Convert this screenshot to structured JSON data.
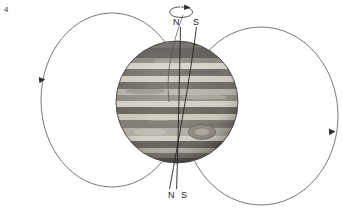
{
  "figure": {
    "number": "4"
  },
  "labels": {
    "top_north": "N",
    "top_south": "S",
    "bottom_north": "N",
    "bottom_south": "S"
  },
  "icons": {
    "rotation_arrow": "rotation-direction-arrow",
    "left_field_arrow": "field-line-direction-arrow-left",
    "right_field_arrow": "field-line-direction-arrow-right"
  },
  "colors": {
    "background": "#ffffff",
    "line": "#4a4a4a",
    "axis_line": "#2b2b2b",
    "text": "#1a1a1a",
    "planet_light_band": "#d8d3c8",
    "planet_dark_band": "#6d6a64",
    "planet_mid_band": "#9b968c",
    "planet_edge": "#3d3b37",
    "red_spot": "#8d867c"
  },
  "planet": {
    "name": "jupiter",
    "center_x": 177,
    "center_y": 102,
    "radius": 61,
    "great_red_spot": {
      "cx": 202,
      "cy": 132,
      "rx": 13,
      "ry": 7
    },
    "bands": [
      {
        "y": 0.06,
        "h": 0.09,
        "tone": "dark"
      },
      {
        "y": 0.16,
        "h": 0.05,
        "tone": "light"
      },
      {
        "y": 0.21,
        "h": 0.06,
        "tone": "dark"
      },
      {
        "y": 0.28,
        "h": 0.05,
        "tone": "light"
      },
      {
        "y": 0.33,
        "h": 0.06,
        "tone": "mid"
      },
      {
        "y": 0.4,
        "h": 0.05,
        "tone": "light"
      },
      {
        "y": 0.45,
        "h": 0.07,
        "tone": "dark"
      },
      {
        "y": 0.53,
        "h": 0.05,
        "tone": "light"
      },
      {
        "y": 0.58,
        "h": 0.06,
        "tone": "mid"
      },
      {
        "y": 0.65,
        "h": 0.05,
        "tone": "light"
      },
      {
        "y": 0.71,
        "h": 0.06,
        "tone": "dark"
      },
      {
        "y": 0.78,
        "h": 0.05,
        "tone": "light"
      },
      {
        "y": 0.84,
        "h": 0.07,
        "tone": "dark"
      },
      {
        "y": 0.92,
        "h": 0.05,
        "tone": "mid"
      }
    ]
  },
  "field_loops": [
    {
      "name": "left-field-loop",
      "cx": 112,
      "cy": 100,
      "rx": 71,
      "ry": 87,
      "arrow_x": 42,
      "arrow_y": 80,
      "arrow_direction": "down"
    },
    {
      "name": "right-field-loop",
      "cx": 261,
      "cy": 116,
      "rx": 77,
      "ry": 89,
      "arrow_x": 332,
      "arrow_y": 132,
      "arrow_direction": "down"
    }
  ],
  "axes": [
    {
      "name": "rotation-axis",
      "x1": 180,
      "y1": 28,
      "x2": 177,
      "y2": 188,
      "style": "straight"
    },
    {
      "name": "magnetic-axis",
      "x1": 196,
      "y1": 28,
      "x2": 170,
      "y2": 188,
      "style": "tilted"
    }
  ],
  "rotation_indicator": {
    "cx": 181,
    "cy": 12,
    "rx": 11,
    "ry": 5,
    "arrow_at": "top-right",
    "meaning": "planet-rotation-direction"
  }
}
